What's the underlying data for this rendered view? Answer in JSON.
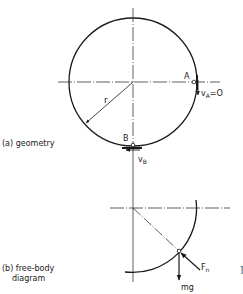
{
  "geometry": {
    "caption": "(a) geometry",
    "point_a": "A",
    "point_b": "B",
    "radius_label": "r",
    "velocity_a": "v",
    "velocity_a_sub": "A",
    "velocity_a_value": "=O",
    "velocity_b": "v",
    "velocity_b_sub": "B"
  },
  "free_body": {
    "caption_line1": "(b) free-body",
    "caption_line2": "diagram",
    "force_normal": "F",
    "force_normal_sub": "n",
    "force_weight": "mg",
    "bracket": "]"
  },
  "colors": {
    "line": "#1a1a1a",
    "background": "#ffffff"
  }
}
